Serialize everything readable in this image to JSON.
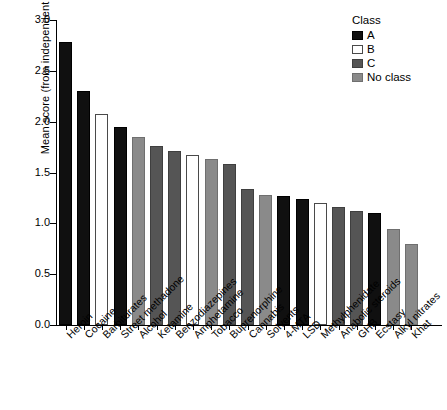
{
  "chart_data": {
    "type": "bar",
    "title": "",
    "xlabel": "",
    "ylabel": "Mean score (from independent experts)",
    "ylim": [
      0,
      3.0
    ],
    "ytick_labels": [
      "0.0",
      "0.5",
      "1.0",
      "1.5",
      "2.0",
      "2.5",
      "3.0"
    ],
    "ytick_values": [
      0,
      0.5,
      1.0,
      1.5,
      2.0,
      2.5,
      3.0
    ],
    "grid": false,
    "legend": {
      "title": "Class",
      "position": "top-right",
      "entries": [
        {
          "label": "A",
          "key": "A",
          "color": "#101010"
        },
        {
          "label": "B",
          "key": "B",
          "color": "#ffffff"
        },
        {
          "label": "C",
          "key": "C",
          "color": "#555555"
        },
        {
          "label": "No class",
          "key": "N",
          "color": "#8a8a8a"
        }
      ]
    },
    "categories": [
      "Heroin",
      "Cocaine",
      "Barbiturates",
      "Street methadone",
      "Alcohol",
      "Ketamine",
      "Benzodiazepines",
      "Amphetamine",
      "Tobacco",
      "Buprenorphine",
      "Cannabis",
      "Solvents",
      "4-MTA",
      "LSD",
      "Methylphenidate",
      "Anabolic steroids",
      "GHB",
      "Ecstasy",
      "Alkyl nitrates",
      "Khat"
    ],
    "values": [
      2.78,
      2.3,
      2.08,
      1.95,
      1.85,
      1.76,
      1.71,
      1.67,
      1.63,
      1.58,
      1.34,
      1.28,
      1.27,
      1.24,
      1.2,
      1.16,
      1.12,
      1.1,
      0.94,
      0.8
    ],
    "classes": [
      "A",
      "A",
      "B",
      "A",
      "N",
      "C",
      "C",
      "B",
      "N",
      "C",
      "C",
      "N",
      "A",
      "A",
      "B",
      "C",
      "C",
      "A",
      "N",
      "N"
    ]
  }
}
